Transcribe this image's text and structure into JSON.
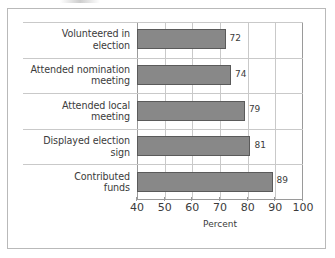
{
  "chart_data": {
    "type": "bar",
    "orientation": "horizontal",
    "title": "",
    "subtitle": "",
    "xlabel": "Percent",
    "ylabel": "",
    "categories": [
      "Volunteered in election",
      "Attended nomination meeting",
      "Attended local meeting",
      "Displayed election sign",
      "Contributed funds"
    ],
    "category_lines": [
      [
        "Volunteered in",
        "election"
      ],
      [
        "Attended nomination",
        "meeting"
      ],
      [
        "Attended local",
        "meeting"
      ],
      [
        "Displayed election",
        "sign"
      ],
      [
        "Contributed",
        "funds"
      ]
    ],
    "values": [
      72,
      74,
      79,
      81,
      89
    ],
    "value_labels": [
      "72",
      "74",
      "79",
      "81",
      "89"
    ],
    "xlim": [
      40,
      100
    ],
    "xticks": [
      40,
      50,
      60,
      70,
      80,
      90,
      100
    ],
    "xtick_labels": [
      "40",
      "50",
      "60",
      "70",
      "80",
      "90",
      "100"
    ],
    "grid": "vertical",
    "legend": "none",
    "bar_fill_color": "#888888",
    "bar_border_color": "#5a5a5a",
    "gridline_color": "#c9c9c9",
    "axis_color": "#9a9a9a",
    "text_color": "#3b3b3b",
    "background_color": "#ffffff",
    "frame_color": "#b9b9b9"
  }
}
